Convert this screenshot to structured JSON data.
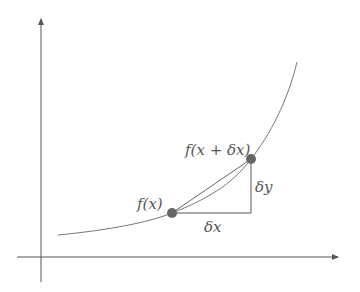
{
  "diagram": {
    "type": "derivative-secant-illustration",
    "colors": {
      "axis": "#555555",
      "curve": "#777777",
      "point": "#666666",
      "label": "#555555",
      "background": "#ffffff"
    },
    "axes": {
      "x_axis": {
        "from": [
          17,
          257
        ],
        "to": [
          338,
          257
        ],
        "arrow": true
      },
      "y_axis": {
        "from": [
          41,
          282
        ],
        "to": [
          41,
          18
        ],
        "arrow": true
      }
    },
    "curve": {
      "description": "increasing convex curve",
      "path_points": [
        [
          58,
          235
        ],
        [
          172,
          213
        ],
        [
          251,
          159
        ],
        [
          297,
          62
        ]
      ]
    },
    "points": [
      {
        "name": "p1",
        "x": 172,
        "y": 213,
        "label": "f(x)"
      },
      {
        "name": "p2",
        "x": 251,
        "y": 159,
        "label": "f(x + δx)"
      }
    ],
    "triangle": {
      "horizontal_leg_label": "δx",
      "vertical_leg_label": "δy"
    },
    "labels": {
      "fx": "f(x)",
      "fx_dx": "f(x + δx)",
      "dx": "δx",
      "dy": "δy"
    }
  }
}
